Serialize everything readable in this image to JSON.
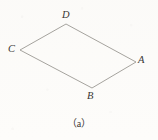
{
  "figure": {
    "caption": "（a）",
    "shape_name": "parallelogram-ABCD",
    "background_color": "#fdfcfa",
    "line_color": "#9b9893",
    "label_color": "#3a3734",
    "vertices": [
      {
        "id": "D",
        "label": "D",
        "x": 66,
        "y": 24
      },
      {
        "id": "C",
        "label": "C",
        "x": 20,
        "y": 50
      },
      {
        "id": "B",
        "label": "B",
        "x": 92,
        "y": 88
      },
      {
        "id": "A",
        "label": "A",
        "x": 136,
        "y": 62
      }
    ],
    "edges": [
      {
        "from": "C",
        "to": "D"
      },
      {
        "from": "D",
        "to": "A"
      },
      {
        "from": "A",
        "to": "B"
      },
      {
        "from": "B",
        "to": "C"
      }
    ]
  }
}
